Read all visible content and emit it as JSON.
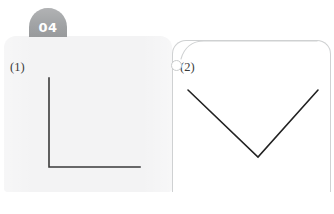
{
  "page": {
    "width": 334,
    "height": 214,
    "background_color": "#ffffff"
  },
  "badge": {
    "number": "04",
    "shape": "dome",
    "fill_color": "#a0a2a4",
    "text_color": "#ffffff"
  },
  "panels": {
    "left": {
      "name": "figure-panel-1",
      "background_color": "#f3f3f4",
      "label": "(1)"
    },
    "right": {
      "name": "figure-panel-2",
      "background_color": "#ffffff",
      "border_color": "#cfd1d2",
      "label": "(2)",
      "ornament": "ring-hook"
    }
  },
  "figures": [
    {
      "id": "figure-1",
      "label": "(1)",
      "type": "angle-lines",
      "description": "right angle formed by a vertical ray and a horizontal ray meeting at a lower-left vertex",
      "stroke_color": "#3a3a3a",
      "stroke_width": 1.6,
      "vertex": [
        49,
        167
      ],
      "points": [
        [
          49,
          78
        ],
        [
          49,
          167
        ],
        [
          140,
          167
        ]
      ]
    },
    {
      "id": "figure-2",
      "label": "(2)",
      "type": "angle-lines",
      "description": "acute V angle formed by two rays meeting at a bottom vertex",
      "stroke_color": "#222222",
      "stroke_width": 1.6,
      "vertex": [
        258,
        157
      ],
      "points": [
        [
          188,
          90
        ],
        [
          258,
          157
        ],
        [
          318,
          90
        ]
      ]
    }
  ]
}
